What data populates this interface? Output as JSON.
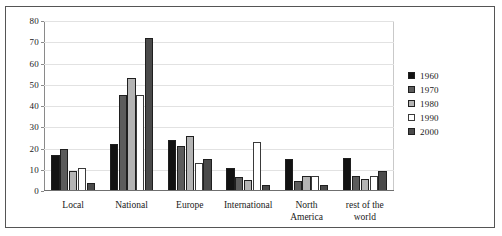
{
  "chart_data": {
    "type": "bar",
    "title": "",
    "subtitle": "",
    "xlabel": "",
    "ylabel": "",
    "ylim": [
      0,
      80
    ],
    "ytick_step": 10,
    "yticks": [
      "0",
      "10",
      "20",
      "30",
      "40",
      "50",
      "60",
      "70",
      "80"
    ],
    "grid": "horizontal",
    "legend_position": "right",
    "categories": [
      "Local",
      "National",
      "Europe",
      "International",
      "North\nAmerica",
      "rest of the\nworld"
    ],
    "series": [
      {
        "name": "1960",
        "color": "#121212",
        "values": [
          17,
          22,
          24,
          11,
          15,
          15.5
        ]
      },
      {
        "name": "1970",
        "color": "#5c5c5c",
        "values": [
          20,
          45,
          21,
          6.5,
          4.5,
          7
        ]
      },
      {
        "name": "1980",
        "color": "#b4b4b4",
        "values": [
          9.5,
          53,
          26,
          5,
          7,
          5.5
        ]
      },
      {
        "name": "1990",
        "color": "#ffffff",
        "values": [
          11,
          45,
          13,
          23,
          7,
          7
        ]
      },
      {
        "name": "2000",
        "color": "#4a4a4a",
        "values": [
          4,
          72,
          15,
          3,
          3,
          9.5
        ]
      }
    ]
  }
}
